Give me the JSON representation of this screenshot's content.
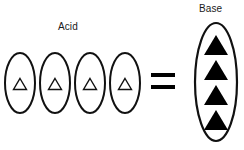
{
  "diagram": {
    "title_acid": "Acid",
    "title_base": "Base",
    "equals_symbol": "=",
    "stroke_color": "#111111",
    "fill_color": "#000000",
    "background_color": "#ffffff",
    "acid": {
      "label": "Acid",
      "count": 4,
      "particle_style": "outlined-triangle",
      "containers": [
        {
          "cx": 20,
          "cy": 83,
          "rx": 15,
          "ry": 30
        },
        {
          "cx": 55,
          "cy": 83,
          "rx": 15,
          "ry": 30
        },
        {
          "cx": 90,
          "cy": 83,
          "rx": 15,
          "ry": 30
        },
        {
          "cx": 125,
          "cy": 83,
          "rx": 15,
          "ry": 30
        }
      ],
      "triangles": [
        {
          "cx": 20,
          "cy": 84,
          "w": 13,
          "h": 11
        },
        {
          "cx": 55,
          "cy": 84,
          "w": 13,
          "h": 11
        },
        {
          "cx": 90,
          "cy": 84,
          "w": 13,
          "h": 11
        },
        {
          "cx": 125,
          "cy": 84,
          "w": 13,
          "h": 11
        }
      ]
    },
    "base": {
      "label": "Base",
      "count": 4,
      "particle_style": "filled-triangle",
      "container": {
        "cx": 216,
        "cy": 82,
        "rx": 21,
        "ry": 59
      },
      "triangles": [
        {
          "cx": 216,
          "cy": 45,
          "w": 24,
          "h": 20
        },
        {
          "cx": 216,
          "cy": 70,
          "w": 24,
          "h": 20
        },
        {
          "cx": 216,
          "cy": 95,
          "w": 24,
          "h": 20
        },
        {
          "cx": 216,
          "cy": 120,
          "w": 24,
          "h": 20
        }
      ]
    },
    "equals": {
      "symbol": "=",
      "bar_top_y": 74,
      "bar_bottom_y": 86,
      "x_start": 151,
      "x_end": 175,
      "thickness": 4
    }
  }
}
